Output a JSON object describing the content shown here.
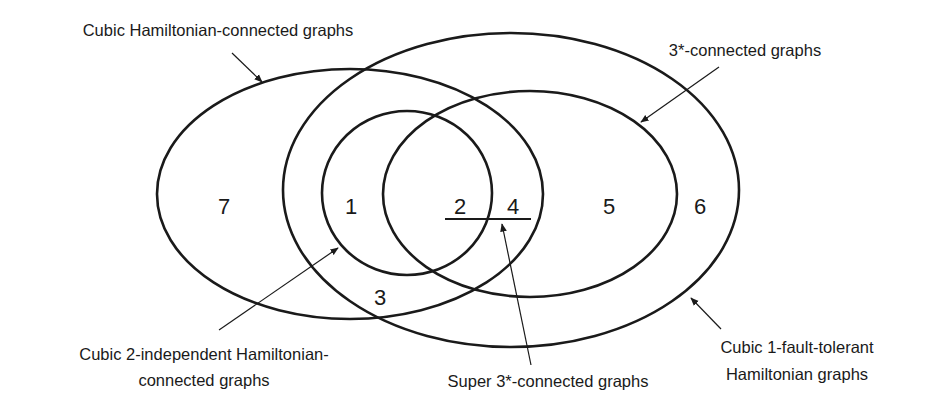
{
  "diagram": {
    "type": "venn",
    "sets": [
      {
        "id": "hamiltonian_connected",
        "label": "Cubic Hamiltonian-connected graphs"
      },
      {
        "id": "one_fault_tolerant",
        "label_lines": [
          "Cubic 1-fault-tolerant",
          "Hamiltonian graphs"
        ]
      },
      {
        "id": "three_star_connected",
        "label": "3*-connected graphs"
      },
      {
        "id": "two_independent",
        "label_lines": [
          "Cubic 2-independent Hamiltonian-",
          "connected graphs"
        ]
      },
      {
        "id": "super_three_star",
        "label": "Super 3*-connected graphs"
      }
    ],
    "regions": {
      "r1": "1",
      "r2": "2",
      "r3": "3",
      "r4": "4",
      "r5": "5",
      "r6": "6",
      "r7": "7"
    },
    "colors": {
      "stroke": "#1a1a1a",
      "background": "#ffffff"
    }
  }
}
